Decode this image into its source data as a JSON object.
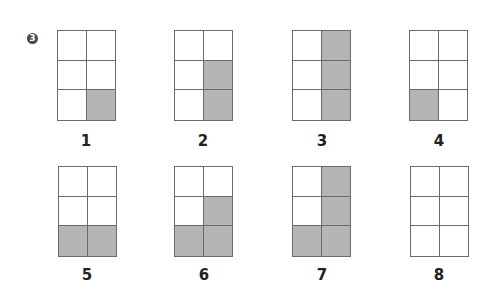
{
  "problem_number": "3",
  "colors": {
    "shade": "#b5b5b5",
    "line": "#6b6b6b",
    "badge": "#4a4a4a"
  },
  "grid_spec": {
    "rows": 3,
    "cols": 2
  },
  "figures": [
    {
      "label": "1",
      "shaded": [
        [
          0,
          0
        ],
        [
          0,
          0
        ],
        [
          0,
          1
        ]
      ]
    },
    {
      "label": "2",
      "shaded": [
        [
          0,
          0
        ],
        [
          0,
          1
        ],
        [
          0,
          1
        ]
      ]
    },
    {
      "label": "3",
      "shaded": [
        [
          0,
          1
        ],
        [
          0,
          1
        ],
        [
          0,
          1
        ]
      ]
    },
    {
      "label": "4",
      "shaded": [
        [
          0,
          0
        ],
        [
          0,
          0
        ],
        [
          1,
          0
        ]
      ]
    },
    {
      "label": "5",
      "shaded": [
        [
          0,
          0
        ],
        [
          0,
          0
        ],
        [
          1,
          1
        ]
      ]
    },
    {
      "label": "6",
      "shaded": [
        [
          0,
          0
        ],
        [
          0,
          1
        ],
        [
          1,
          1
        ]
      ]
    },
    {
      "label": "7",
      "shaded": [
        [
          0,
          1
        ],
        [
          0,
          1
        ],
        [
          1,
          1
        ]
      ]
    },
    {
      "label": "8",
      "shaded": [
        [
          0,
          0
        ],
        [
          0,
          0
        ],
        [
          0,
          0
        ]
      ]
    }
  ]
}
